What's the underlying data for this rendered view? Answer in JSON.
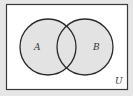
{
  "diagram": {
    "type": "venn",
    "universe_label": "U",
    "sets": [
      {
        "label": "A",
        "cx": 48,
        "cy": 47,
        "r": 28
      },
      {
        "label": "B",
        "cx": 85,
        "cy": 47,
        "r": 28
      }
    ],
    "shaded_region": "A ∪ B",
    "colors": {
      "background": "#e6e6e6",
      "universe_fill": "#ffffff",
      "set_fill": "#e3e3e3",
      "stroke": "#2a2a2a"
    }
  }
}
